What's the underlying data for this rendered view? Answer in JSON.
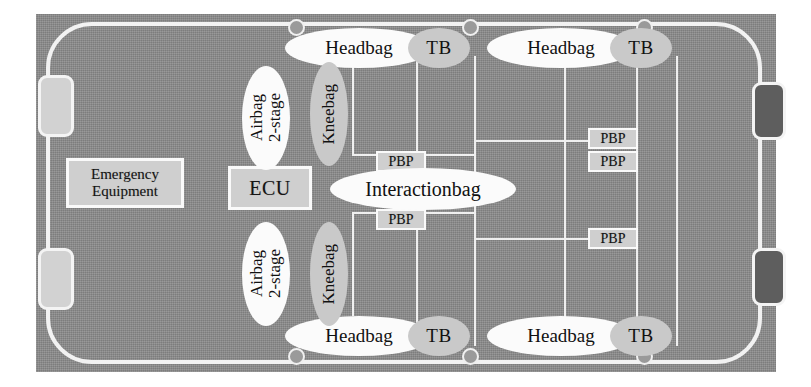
{
  "diagram": {
    "colors": {
      "body_gray": "#8a8a8a",
      "outline_white": "#f2f2f2",
      "box_fill": "#cfcfcf",
      "ellipse_white": "#fbfbfb",
      "ellipse_gray": "#c9c9c9",
      "rear_block_dark": "#5e5e5e"
    },
    "boxes": {
      "emergency_equipment": "Emergency\nEquipment",
      "emergency_equipment_line1": "Emergency",
      "emergency_equipment_line2": "Equipment",
      "ecu": "ECU",
      "pbp": "PBP"
    },
    "ellipses": {
      "headbag": "Headbag",
      "tb": "TB",
      "airbag_line1": "Airbag",
      "airbag_line2": "2-stage",
      "airbag_full": "Airbag 2-stage",
      "kneebag": "Kneebag",
      "interactionbag": "Interactionbag"
    },
    "components": [
      {
        "name": "Emergency Equipment",
        "position": "front-left of cabin",
        "count": 1
      },
      {
        "name": "ECU",
        "position": "center front",
        "count": 1
      },
      {
        "name": "Interactionbag",
        "position": "center",
        "count": 1
      },
      {
        "name": "Airbag 2-stage",
        "position": "front row, driver and passenger",
        "count": 2
      },
      {
        "name": "Kneebag",
        "position": "front row, driver and passenger",
        "count": 2
      },
      {
        "name": "Headbag",
        "position": "side rails, four seating locations",
        "count": 4
      },
      {
        "name": "TB",
        "position": "side rails, four seating locations",
        "count": 4
      },
      {
        "name": "PBP",
        "position": "two front center, three rear right",
        "count": 5
      }
    ],
    "pbp_labels": {
      "front_top": "PBP",
      "front_bottom": "PBP",
      "rear_a": "PBP",
      "rear_b": "PBP",
      "rear_c": "PBP"
    },
    "headbag_labels": {
      "front_left": "Headbag",
      "rear_left": "Headbag",
      "front_right": "Headbag",
      "rear_right": "Headbag"
    },
    "tb_labels": {
      "front_left": "TB",
      "rear_left": "TB",
      "front_right": "TB",
      "rear_right": "TB"
    },
    "sensor_count": 8
  }
}
